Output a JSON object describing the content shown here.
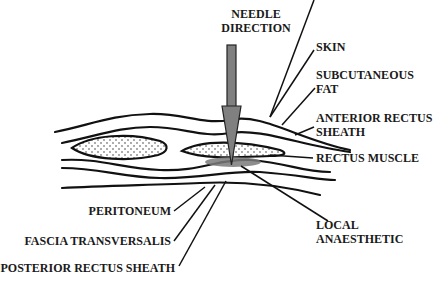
{
  "diagram": {
    "title_lines": [
      "NEEDLE",
      "DIRECTION"
    ],
    "labels": {
      "skin": [
        "SKIN"
      ],
      "subcutaneous_fat": [
        "SUBCUTANEOUS",
        "FAT"
      ],
      "anterior_rectus_sheath": [
        "ANTERIOR RECTUS",
        "SHEATH"
      ],
      "rectus_muscle": [
        "RECTUS MUSCLE"
      ],
      "local_anaesthetic": [
        "LOCAL",
        "ANAESTHETIC"
      ],
      "peritoneum": [
        "PERITONEUM"
      ],
      "fascia_transversalis": [
        "FASCIA TRANSVERSALIS"
      ],
      "posterior_rectus_sheath": [
        "POSTERIOR RECTUS SHEATH"
      ]
    },
    "colors": {
      "needle": "#808080",
      "anaesthetic": "#7a7a7a",
      "lines": "#111111",
      "background": "#ffffff"
    }
  }
}
